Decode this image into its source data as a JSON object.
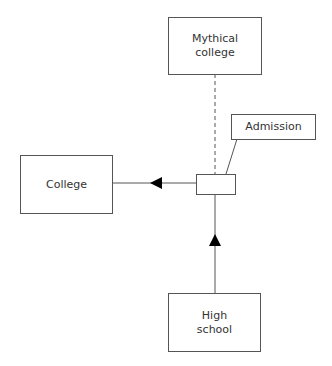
{
  "diagram": {
    "nodes": [
      {
        "id": "mythical-college",
        "label": "Mythical\ncollege"
      },
      {
        "id": "admission",
        "label": "Admission"
      },
      {
        "id": "college",
        "label": "College"
      },
      {
        "id": "high-school",
        "label": "High\nschool"
      },
      {
        "id": "junction",
        "label": ""
      }
    ],
    "edges": [
      {
        "from": "junction",
        "to": "mythical-college",
        "style": "dashed"
      },
      {
        "from": "high-school",
        "to": "junction",
        "style": "solid",
        "arrow": "up"
      },
      {
        "from": "junction",
        "to": "college",
        "style": "solid",
        "arrow": "left"
      },
      {
        "from": "admission",
        "to": "junction",
        "style": "callout"
      }
    ]
  }
}
